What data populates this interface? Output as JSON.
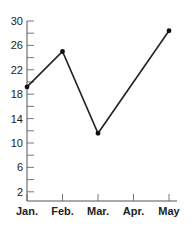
{
  "chart_data": {
    "type": "line",
    "title": "",
    "xlabel": "",
    "ylabel": "",
    "categories": [
      "Jan.",
      "Feb.",
      "Mar.",
      "Apr.",
      "May"
    ],
    "series": [
      {
        "name": "Series 1",
        "x": [
          "Jan.",
          "Feb.",
          "Mar.",
          "May"
        ],
        "values": [
          19.2,
          25,
          11.6,
          28.4
        ]
      }
    ],
    "yticks": [
      2,
      6,
      10,
      14,
      18,
      22,
      26,
      30
    ],
    "ylim": [
      0,
      30
    ],
    "grid": false,
    "line_color": "#222222"
  }
}
